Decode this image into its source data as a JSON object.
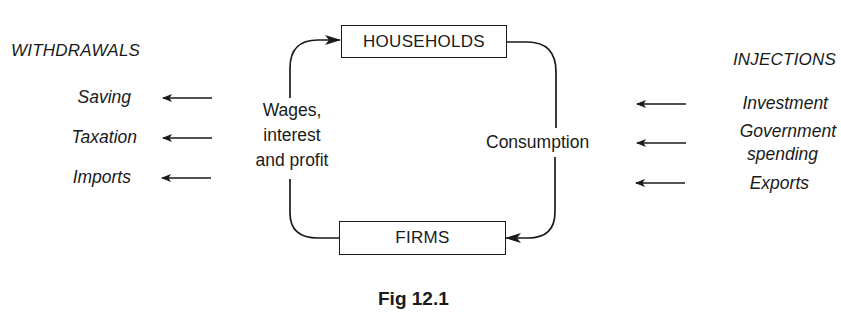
{
  "diagram": {
    "type": "circular-flow-of-income",
    "nodes": {
      "households": "HOUSEHOLDS",
      "firms": "FIRMS"
    },
    "flows": {
      "firms_to_households": "Wages, interest and profit",
      "firms_to_households_lines": [
        "Wages,",
        "interest",
        "and profit"
      ],
      "households_to_firms": "Consumption"
    },
    "withdrawals": {
      "heading": "WITHDRAWALS",
      "items": [
        "Saving",
        "Taxation",
        "Imports"
      ]
    },
    "injections": {
      "heading": "INJECTIONS",
      "items": [
        "Investment",
        "Government spending",
        "Exports"
      ],
      "item_lines": {
        "government_line1": "Government",
        "government_line2": "spending"
      }
    },
    "caption": "Fig 12.1",
    "colors": {
      "ink": "#1a1a1a",
      "background": "#ffffff"
    }
  }
}
